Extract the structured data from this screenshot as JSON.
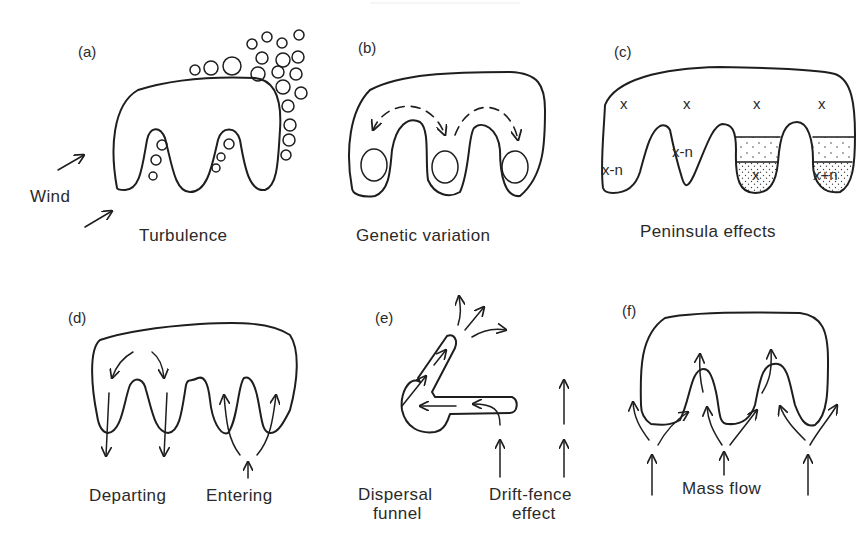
{
  "figure": {
    "panels": [
      {
        "id": "a",
        "tag": "(a)",
        "caption": "Turbulence",
        "side_label": "Wind"
      },
      {
        "id": "b",
        "tag": "(b)",
        "caption": "Genetic variation"
      },
      {
        "id": "c",
        "tag": "(c)",
        "caption": "Peninsula effects",
        "symbols": {
          "x": "x",
          "x_minus_n": "x-n",
          "x_plus_n": "x+n"
        }
      },
      {
        "id": "d",
        "tag": "(d)",
        "captions": [
          "Departing",
          "Entering"
        ]
      },
      {
        "id": "e",
        "tag": "(e)",
        "captions": {
          "left_line1": "Dispersal",
          "left_line2": "funnel",
          "right_line1": "Drift-fence",
          "right_line2": "effect"
        }
      },
      {
        "id": "f",
        "tag": "(f)",
        "caption": "Mass flow"
      }
    ],
    "colors": {
      "ink": "#1e1e1e",
      "text": "#2a2a2a",
      "background": "#ffffff",
      "stipple": "#444444"
    }
  }
}
